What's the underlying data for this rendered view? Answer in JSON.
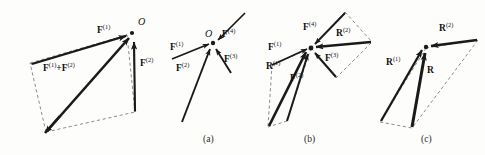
{
  "figure": {
    "background_color": "#fdfdfb",
    "ink_color": "#1a1a1a",
    "dash_color": "#555555",
    "panels": [
      {
        "id": "parallelogram-law",
        "caption": "",
        "labels": {
          "f1": "F",
          "f1_sup": "(1)",
          "f2": "F",
          "f2_sup": "(2)",
          "sum": "F",
          "sum_sup": "(1)",
          "sum_plus": "+F",
          "sum_sup2": "(2)",
          "origin": "O"
        }
      },
      {
        "id": "four-concurrent-forces",
        "caption": "(a)",
        "labels": {
          "f1": "F",
          "f1_sup": "(1)",
          "f2": "F",
          "f2_sup": "(2)",
          "f3": "F",
          "f3_sup": "(3)",
          "f4": "F",
          "f4_sup": "(4)",
          "origin": "O"
        }
      },
      {
        "id": "pairwise-resultants",
        "caption": "(b)",
        "labels": {
          "f1": "F",
          "f1_sup": "(1)",
          "f2": "F",
          "f2_sup": "(2)",
          "f3": "F",
          "f3_sup": "(3)",
          "f4": "F",
          "f4_sup": "(4)",
          "r1": "R",
          "r1_sup": "(1)",
          "r2": "R",
          "r2_sup": "(2)"
        }
      },
      {
        "id": "final-resultant",
        "caption": "(c)",
        "labels": {
          "r1": "R",
          "r1_sup": "(1)",
          "r2": "R",
          "r2_sup": "(2)",
          "r": "R"
        }
      }
    ]
  }
}
